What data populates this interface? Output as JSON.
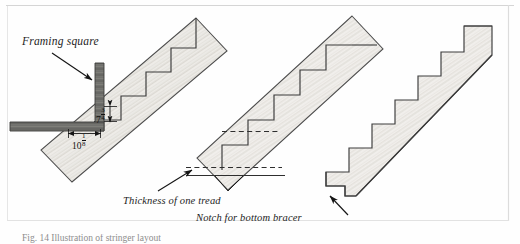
{
  "figure": {
    "background_color": "#fefefe",
    "border_color": "#d8d8d8",
    "ink_color": "#1d1d1d",
    "wood_fill_color": "#eceae6",
    "square_fill_color": "#6a6a68"
  },
  "labels": {
    "framing_square": "Framing square",
    "thickness_of_one_tread": "Thickness of one tread",
    "notch_for_bottom_bracer": "Notch for bottom bracer",
    "figure_number": "Fig. 14 Illustration of stringer layout"
  },
  "dimensions": {
    "riser": {
      "whole": "7",
      "numerator": "3",
      "denominator": "4",
      "text": "7 3/4"
    },
    "tread": {
      "whole": "10",
      "numerator": "1",
      "denominator": "8",
      "text": "10 1/8"
    }
  },
  "panels": [
    {
      "name": "stringer-marked",
      "description": "Framing square laid against a sloped board with stepped layout lines marked"
    },
    {
      "name": "stringer-bottom-detail",
      "description": "Sloped board with dashed lines showing tread thickness deduction at the bottom"
    },
    {
      "name": "stringer-cut",
      "description": "Finished cut stringer with notch at the bottom end"
    }
  ]
}
